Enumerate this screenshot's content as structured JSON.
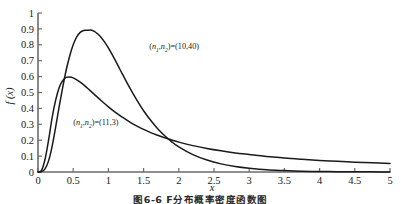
{
  "figure": {
    "caption": "图6-6  F分布概率密度函数图"
  },
  "chart_data": {
    "type": "line",
    "title": "",
    "xlabel": "x",
    "ylabel": "f (x)",
    "xlim": [
      0,
      5
    ],
    "ylim": [
      0,
      1
    ],
    "xticks": [
      "0",
      "0.5",
      "1",
      "1.5",
      "2",
      "2.5",
      "3",
      "3.5",
      "4",
      "4.5",
      "5"
    ],
    "xtick_values": [
      0,
      0.5,
      1,
      1.5,
      2,
      2.5,
      3,
      3.5,
      4,
      4.5,
      5
    ],
    "yticks": [
      "0",
      "0.1",
      "0.2",
      "0.3",
      "0.4",
      "0.5",
      "0.6",
      "0.7",
      "0.8",
      "0.9",
      "1"
    ],
    "ytick_values": [
      0,
      0.1,
      0.2,
      0.3,
      0.4,
      0.5,
      0.6,
      0.7,
      0.8,
      0.9,
      1.0
    ],
    "grid": false,
    "legend": "inline-annotations",
    "line_color": "#1a1a1a",
    "axis_color": "#6b6b6b",
    "series": [
      {
        "name": "(n1,n2)=(10,40)",
        "label_text": "(n1,n2)=(10,40)",
        "label_x": 1.58,
        "label_y": 0.775,
        "peak_x": 0.75,
        "peak_y": 0.89,
        "x": [
          0.0,
          0.05,
          0.1,
          0.15,
          0.2,
          0.25,
          0.3,
          0.35,
          0.4,
          0.45,
          0.5,
          0.55,
          0.6,
          0.65,
          0.7,
          0.75,
          0.8,
          0.85,
          0.9,
          0.95,
          1.0,
          1.1,
          1.2,
          1.3,
          1.4,
          1.5,
          1.6,
          1.7,
          1.8,
          1.9,
          2.0,
          2.2,
          2.4,
          2.6,
          2.8,
          3.0,
          3.25,
          3.5,
          3.75,
          4.0,
          4.25,
          4.5,
          4.75,
          5.0
        ],
        "y": [
          0.0,
          0.002,
          0.02,
          0.07,
          0.16,
          0.28,
          0.41,
          0.53,
          0.64,
          0.73,
          0.8,
          0.85,
          0.878,
          0.89,
          0.891,
          0.893,
          0.885,
          0.868,
          0.845,
          0.815,
          0.78,
          0.7,
          0.615,
          0.532,
          0.455,
          0.385,
          0.325,
          0.272,
          0.228,
          0.19,
          0.158,
          0.109,
          0.075,
          0.051,
          0.035,
          0.024,
          0.014,
          0.009,
          0.005,
          0.003,
          0.002,
          0.001,
          0.001,
          0.0
        ]
      },
      {
        "name": "(n1,n2)=(11,3)",
        "label_text": "(n1,n2)=(11,3)",
        "label_x": 0.5,
        "label_y": 0.295,
        "peak_x": 0.45,
        "peak_y": 0.597,
        "x": [
          0.0,
          0.05,
          0.1,
          0.15,
          0.2,
          0.25,
          0.3,
          0.35,
          0.4,
          0.45,
          0.5,
          0.55,
          0.6,
          0.65,
          0.7,
          0.8,
          0.9,
          1.0,
          1.1,
          1.2,
          1.3,
          1.4,
          1.5,
          1.6,
          1.7,
          1.8,
          1.9,
          2.0,
          2.2,
          2.4,
          2.6,
          2.8,
          3.0,
          3.25,
          3.5,
          3.75,
          4.0,
          4.25,
          4.5,
          4.75,
          5.0
        ],
        "y": [
          0.0,
          0.01,
          0.08,
          0.2,
          0.34,
          0.45,
          0.53,
          0.575,
          0.595,
          0.597,
          0.592,
          0.58,
          0.565,
          0.548,
          0.528,
          0.488,
          0.448,
          0.41,
          0.375,
          0.344,
          0.315,
          0.29,
          0.268,
          0.248,
          0.231,
          0.215,
          0.201,
          0.188,
          0.166,
          0.148,
          0.133,
          0.12,
          0.11,
          0.098,
          0.088,
          0.08,
          0.073,
          0.067,
          0.062,
          0.058,
          0.054
        ]
      }
    ],
    "crossing_point": {
      "x": 1.9,
      "y": 0.195
    }
  }
}
